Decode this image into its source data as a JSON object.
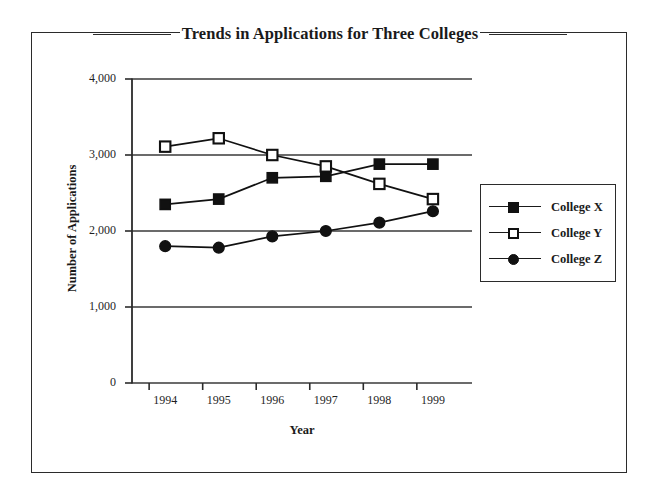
{
  "chart_data": {
    "type": "line",
    "title": "Trends in Applications for Three Colleges",
    "xlabel": "Year",
    "ylabel": "Number of Applications",
    "categories": [
      "1994",
      "1995",
      "1996",
      "1997",
      "1998",
      "1999"
    ],
    "ylim": [
      0,
      4000
    ],
    "yticks": [
      "0",
      "1,000",
      "2,000",
      "3,000",
      "4,000"
    ],
    "ytick_values": [
      0,
      1000,
      2000,
      3000,
      4000
    ],
    "grid": "horizontal",
    "legend_position": "right",
    "series": [
      {
        "name": "College X",
        "marker": "filled-square",
        "values": [
          2350,
          2420,
          2700,
          2720,
          2880,
          2880
        ]
      },
      {
        "name": "College Y",
        "marker": "open-square",
        "values": [
          3110,
          3220,
          3000,
          2850,
          2620,
          2420
        ]
      },
      {
        "name": "College Z",
        "marker": "filled-circle",
        "values": [
          1800,
          1780,
          1930,
          2000,
          2110,
          2260
        ]
      }
    ]
  },
  "legend": {
    "items": [
      {
        "label": "College X",
        "marker": "filled-square"
      },
      {
        "label": "College Y",
        "marker": "open-square"
      },
      {
        "label": "College Z",
        "marker": "filled-circle"
      }
    ]
  },
  "colors": {
    "ink": "#111111",
    "frame": "#2b2b2b",
    "background": "#ffffff"
  }
}
